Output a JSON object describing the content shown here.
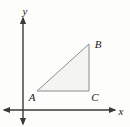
{
  "figure": {
    "kind": "coordinate-plane-triangle",
    "background_color": "#fdfdfb",
    "width": 130,
    "height": 127
  },
  "axes": {
    "color": "#3a3a3a",
    "stroke_width": 1.4,
    "origin": {
      "x": 23,
      "y": 110
    },
    "x_axis": {
      "label": "x",
      "label_position": {
        "x": 121,
        "y": 115
      },
      "start": {
        "x": 4,
        "y": 110
      },
      "end": {
        "x": 115,
        "y": 110
      },
      "arrow_start": true,
      "arrow_end": true
    },
    "y_axis": {
      "label": "y",
      "label_position": {
        "x": 25,
        "y": 15
      },
      "start": {
        "x": 23,
        "y": 124
      },
      "end": {
        "x": 23,
        "y": 18
      },
      "arrow_start": true,
      "arrow_end": true
    }
  },
  "triangle": {
    "name": "triangle-ABC",
    "fill_color": "#f4f4f2",
    "stroke_color": "#8d8d8d",
    "stroke_width": 1,
    "points": "37,91 89,44 89,91",
    "vertices": [
      {
        "id": "A",
        "label": "A",
        "x": 37,
        "y": 91,
        "label_x": 32,
        "label_y": 101
      },
      {
        "id": "B",
        "label": "B",
        "x": 89,
        "y": 44,
        "label_x": 98,
        "label_y": 48
      },
      {
        "id": "C",
        "label": "C",
        "x": 89,
        "y": 91,
        "label_x": 95,
        "label_y": 101
      }
    ],
    "sides": [
      {
        "id": "AB",
        "from": "A",
        "to": "B",
        "role": "hypotenuse"
      },
      {
        "id": "BC",
        "from": "B",
        "to": "C",
        "role": "vertical-leg"
      },
      {
        "id": "CA",
        "from": "C",
        "to": "A",
        "role": "horizontal-leg"
      }
    ]
  },
  "typography": {
    "axis_label_size": 11,
    "vertex_label_size": 11
  }
}
